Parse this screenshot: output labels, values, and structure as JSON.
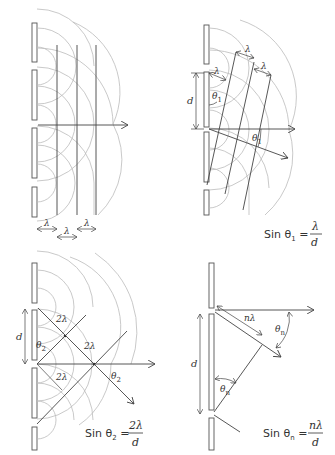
{
  "panels": [
    {
      "id": "zero-order",
      "labels": {
        "lambda1": "λ",
        "lambda2": "λ",
        "lambda3": "λ"
      }
    },
    {
      "id": "first-order",
      "labels": {
        "lambda_a": "λ",
        "lambda_b": "λ",
        "lambda_c": "λ",
        "d": "d",
        "theta_top": "θ",
        "theta_top_sub": "1",
        "theta_ray": "θ",
        "theta_ray_sub": "1"
      },
      "equation": {
        "prefix": "Sin θ",
        "sub": "1",
        "eq": " = ",
        "num": "λ",
        "den": "d"
      }
    },
    {
      "id": "second-order",
      "labels": {
        "two_lambda_a": "2λ",
        "two_lambda_b": "2λ",
        "two_lambda_c": "2λ",
        "d": "d",
        "theta_left": "θ",
        "theta_left_sub": "2",
        "theta_ray": "θ",
        "theta_ray_sub": "2"
      },
      "equation": {
        "prefix": "Sin θ",
        "sub": "2",
        "eq": " = ",
        "num": "2λ",
        "den": "d"
      }
    },
    {
      "id": "nth-order",
      "labels": {
        "n_lambda": "nλ",
        "d": "d",
        "theta_right": "θ",
        "theta_right_sub": "n",
        "theta_left": "θ",
        "theta_left_sub": "n"
      },
      "equation": {
        "prefix": "Sin θ",
        "sub": "n",
        "eq": " = ",
        "num": "nλ",
        "den": "d"
      }
    }
  ]
}
